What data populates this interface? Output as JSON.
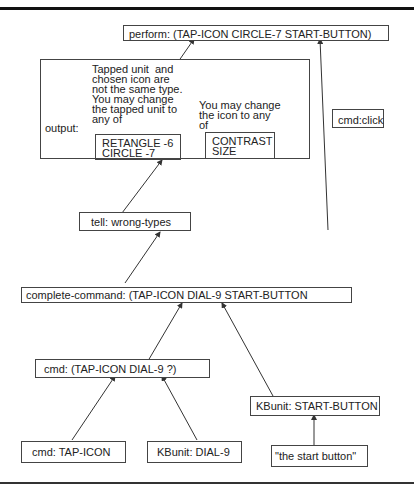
{
  "diagram": {
    "nodes": {
      "perform": "perform: (TAP-ICON CIRCLE-7  START-BUTTON)",
      "cmd_click": "cmd:click",
      "output_label": "output:",
      "output_msg1": "Tapped unit  and\nchosen icon are\nnot the same type.\nYou may change\nthe tapped unit to\nany of",
      "output_msg2": "You may change\nthe icon to any\nof",
      "output_list1": "RETANGLE -6\nCIRCLE -7",
      "output_list2": "CONTRAST\nSIZE",
      "tell": "tell: wrong-types",
      "complete_command": "complete-command: (TAP-ICON DIAL-9  START-BUTTON",
      "cmd_partial": "cmd: (TAP-ICON  DIAL-9   ?)",
      "kbunit_start": "KBunit: START-BUTTON",
      "cmd_tap": "cmd: TAP-ICON",
      "kbunit_dial": "KBunit: DIAL-9",
      "start_phrase": "\"the start button\""
    }
  }
}
